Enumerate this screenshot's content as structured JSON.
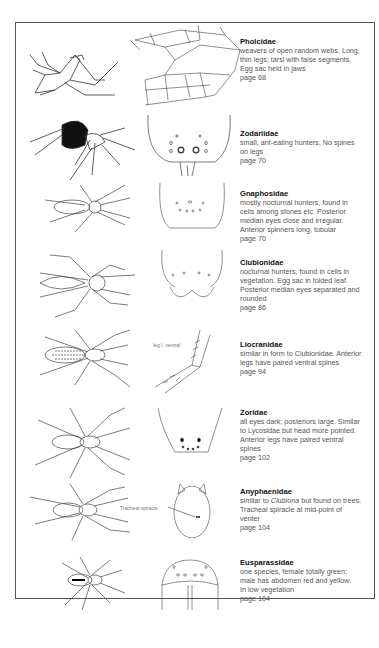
{
  "families": [
    {
      "name": "Pholcidae",
      "lines": [
        "weavers of open random webs. Long,",
        "thin legs; tarsi with false segments.",
        "Egg sac held in jaws"
      ],
      "page": "page 68"
    },
    {
      "name": "Zodariidae",
      "lines": [
        "small, ant-eating hunters. No spines",
        "on legs"
      ],
      "page": "page 70"
    },
    {
      "name": "Gnaphosidae",
      "lines": [
        "mostly nocturnal hunters, found in",
        "cells among stones etc. Posterior",
        "median eyes close and irregular.",
        "Anterior spinners long, tubular"
      ],
      "page": "page 70"
    },
    {
      "name": "Clubionidae",
      "lines": [
        "nocturnal hunters, found in cells in",
        "vegetation. Egg sac in folded leaf.",
        "Posterior median eyes separated and",
        "rounded"
      ],
      "page": "page 86"
    },
    {
      "name": "Liocranidae",
      "lines": [
        "similar in form to Clubionidae. Anterior",
        "legs have paired ventral spines"
      ],
      "page": "page 94"
    },
    {
      "name": "Zoridae",
      "lines": [
        "all eyes dark; posteriors large. Similar",
        "to Lycosidae but head more pointed.",
        "Anterior legs have paired ventral",
        "spines"
      ],
      "page": "page 102"
    },
    {
      "name": "Anyphaenidae",
      "lines_pre": "similar to ",
      "lines_italic": "Clubiona",
      "lines_post": " but found on trees.",
      "lines": [
        "Tracheal spiracle at mid-point of",
        "venter"
      ],
      "page": "page 104"
    },
    {
      "name": "Eusparassidae",
      "lines": [
        "one species, female totally green;",
        "male has abdomen red and yellow.",
        "In low vegetation"
      ],
      "page": "page 104"
    }
  ],
  "labels": {
    "leg_ventral": "leg I, ventral",
    "tracheal_spiracle": "Tracheal spiracle"
  }
}
